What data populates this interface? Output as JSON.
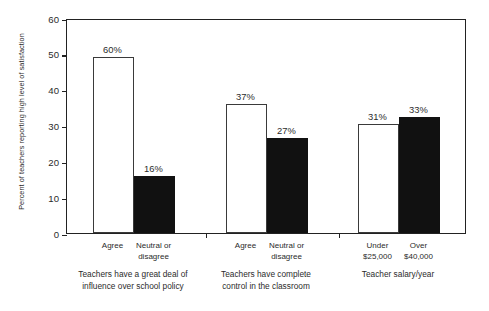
{
  "chart_data": {
    "type": "bar",
    "title": "",
    "subtitle": "",
    "xlabel": "",
    "ylabel": "Percent of teachers reporting high level of satisfaction",
    "ylim": [
      0,
      60
    ],
    "yticks": [
      "0",
      "10",
      "20",
      "30",
      "40",
      "50",
      "60"
    ],
    "grid": false,
    "legend": null,
    "categories": [
      "Agree",
      "Neutral or\ndisagree",
      "Agree",
      "Neutral or\ndisagree",
      "Under\n$25,000",
      "Over\n$40,000"
    ],
    "values": [
      49,
      16,
      36,
      26.5,
      30.5,
      32.5
    ],
    "data_labels": [
      "60%",
      "16%",
      "37%",
      "27%",
      "31%",
      "33%"
    ],
    "bar_colors": [
      "#ffffff",
      "#111111",
      "#ffffff",
      "#111111",
      "#ffffff",
      "#111111"
    ],
    "groups": [
      {
        "caption": "Teachers have a great deal of\ninfluence over school policy",
        "bars": [
          {
            "label": "Agree",
            "value": 49,
            "data_label": "60%",
            "fill": "white"
          },
          {
            "label": "Neutral or\ndisagree",
            "value": 16,
            "data_label": "16%",
            "fill": "black"
          }
        ]
      },
      {
        "caption": "Teachers have complete\ncontrol in the classroom",
        "bars": [
          {
            "label": "Agree",
            "value": 36,
            "data_label": "37%",
            "fill": "white"
          },
          {
            "label": "Neutral or\ndisagree",
            "value": 26.5,
            "data_label": "27%",
            "fill": "black"
          }
        ]
      },
      {
        "caption": "Teacher salary/year",
        "bars": [
          {
            "label": "Under\n$25,000",
            "value": 30.5,
            "data_label": "31%",
            "fill": "white"
          },
          {
            "label": "Over\n$40,000",
            "value": 32.5,
            "data_label": "33%",
            "fill": "black"
          }
        ]
      }
    ]
  }
}
